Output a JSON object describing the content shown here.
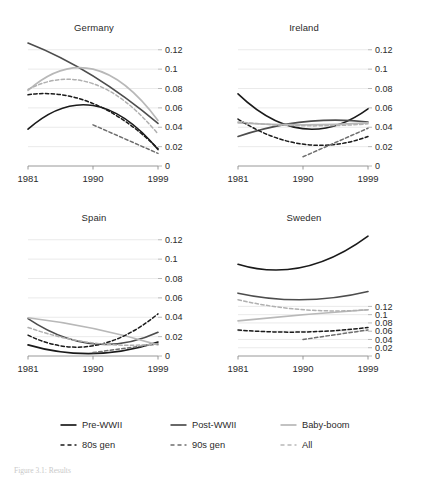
{
  "figure": {
    "caption": "Figure 3.1: Results"
  },
  "chart_data": [
    {
      "type": "line",
      "title": "Germany",
      "xlabel": "",
      "ylabel": "",
      "x": [
        1981,
        1990,
        1999
      ],
      "xticks": [
        "1981",
        "1990",
        "1999"
      ],
      "yticks": [
        "0",
        "0.02",
        "0.04",
        "0.06",
        "0.08",
        "0.1",
        "0.12"
      ],
      "ytickvalues": [
        0,
        0.02,
        0.04,
        0.06,
        0.08,
        0.1,
        0.12
      ],
      "ylim": [
        0,
        0.128
      ],
      "grid": true,
      "legend_position": "below-figure",
      "series": [
        {
          "name": "Pre-WWII",
          "style": "solid",
          "color": "#1a1a1a",
          "values": [
            0.038,
            0.0625,
            0.017
          ]
        },
        {
          "name": "Post-WWII",
          "style": "solid",
          "color": "#4d4d4d",
          "values": [
            0.127,
            0.093,
            0.044
          ]
        },
        {
          "name": "Baby-boom",
          "style": "solid",
          "color": "#b8b8b8",
          "values": [
            0.078,
            0.1,
            0.047
          ]
        },
        {
          "name": "80s gen",
          "style": "dashed",
          "color": "#1a1a1a",
          "values": [
            0.0735,
            0.0645,
            0.018
          ]
        },
        {
          "name": "90s gen",
          "style": "dashed",
          "color": "#6e6e6e",
          "values": [
            null,
            0.0425,
            0.013
          ]
        },
        {
          "name": "All",
          "style": "dashed",
          "color": "#b0b0b0",
          "values": [
            0.079,
            0.085,
            0.033
          ]
        }
      ]
    },
    {
      "type": "line",
      "title": "Ireland",
      "xlabel": "",
      "ylabel": "",
      "x": [
        1981,
        1990,
        1999
      ],
      "xticks": [
        "1981",
        "1990",
        "1999"
      ],
      "yticks": [
        "0",
        "0.02",
        "0.04",
        "0.06",
        "0.08",
        "0.1",
        "0.12"
      ],
      "ytickvalues": [
        0,
        0.02,
        0.04,
        0.06,
        0.08,
        0.1,
        0.12
      ],
      "ylim": [
        0,
        0.128
      ],
      "grid": true,
      "legend_position": "below-figure",
      "series": [
        {
          "name": "Pre-WWII",
          "style": "solid",
          "color": "#1a1a1a",
          "values": [
            0.0745,
            0.0385,
            0.059
          ]
        },
        {
          "name": "Post-WWII",
          "style": "solid",
          "color": "#4d4d4d",
          "values": [
            0.0305,
            0.0455,
            0.0455
          ]
        },
        {
          "name": "Baby-boom",
          "style": "solid",
          "color": "#b8b8b8",
          "values": [
            0.0445,
            0.0425,
            0.0445
          ]
        },
        {
          "name": "80s gen",
          "style": "dashed",
          "color": "#1a1a1a",
          "values": [
            0.0485,
            0.0225,
            0.0305
          ]
        },
        {
          "name": "90s gen",
          "style": "dashed",
          "color": "#6e6e6e",
          "values": [
            null,
            0.0095,
            0.039
          ]
        },
        {
          "name": "All",
          "style": "dashed",
          "color": "#b0b0b0",
          "values": [
            0.0455,
            0.0415,
            0.0435
          ]
        }
      ]
    },
    {
      "type": "line",
      "title": "Spain",
      "xlabel": "",
      "ylabel": "",
      "x": [
        1981,
        1990,
        1999
      ],
      "xticks": [
        "1981",
        "1990",
        "1999"
      ],
      "yticks": [
        "0",
        "0.02",
        "0.04",
        "0.06",
        "0.08",
        "0.1",
        "0.12"
      ],
      "ytickvalues": [
        0,
        0.02,
        0.04,
        0.06,
        0.08,
        0.1,
        0.12
      ],
      "ylim": [
        0,
        0.128
      ],
      "grid": true,
      "legend_position": "below-figure",
      "series": [
        {
          "name": "Pre-WWII",
          "style": "solid",
          "color": "#1a1a1a",
          "values": [
            0.0115,
            0.0025,
            0.0145
          ]
        },
        {
          "name": "Post-WWII",
          "style": "solid",
          "color": "#4d4d4d",
          "values": [
            0.0385,
            0.0125,
            0.0245
          ]
        },
        {
          "name": "Baby-boom",
          "style": "solid",
          "color": "#b8b8b8",
          "values": [
            0.0395,
            0.0285,
            0.0115
          ]
        },
        {
          "name": "80s gen",
          "style": "dashed",
          "color": "#1a1a1a",
          "values": [
            0.0215,
            0.0105,
            0.0435
          ]
        },
        {
          "name": "90s gen",
          "style": "dashed",
          "color": "#6e6e6e",
          "values": [
            null,
            0.0035,
            0.0125
          ]
        },
        {
          "name": "All",
          "style": "dashed",
          "color": "#b0b0b0",
          "values": [
            0.0295,
            0.0135,
            0.0125
          ]
        }
      ]
    },
    {
      "type": "line",
      "title": "Sweden",
      "xlabel": "",
      "ylabel": "",
      "x": [
        1981,
        1990,
        1999
      ],
      "xticks": [
        "1981",
        "1990",
        "1999"
      ],
      "yticks": [
        "0",
        "0.02",
        "0.04",
        "0.06",
        "0.08",
        "0.1",
        "0.12"
      ],
      "ytickvalues": [
        0,
        0.02,
        0.04,
        0.06,
        0.08,
        0.1,
        0.12
      ],
      "ylim": [
        0,
        0.3
      ],
      "grid": true,
      "legend_position": "below-figure",
      "note": "axis labels compressed in lower portion of panel",
      "series": [
        {
          "name": "Pre-WWII",
          "style": "solid",
          "color": "#1a1a1a",
          "values": [
            0.222,
            0.215,
            0.29
          ]
        },
        {
          "name": "Post-WWII",
          "style": "solid",
          "color": "#4d4d4d",
          "values": [
            0.152,
            0.136,
            0.156
          ]
        },
        {
          "name": "Baby-boom",
          "style": "solid",
          "color": "#b8b8b8",
          "values": [
            0.085,
            0.1,
            0.112
          ]
        },
        {
          "name": "80s gen",
          "style": "dashed",
          "color": "#1a1a1a",
          "values": [
            0.063,
            0.058,
            0.069
          ]
        },
        {
          "name": "90s gen",
          "style": "dashed",
          "color": "#6e6e6e",
          "values": [
            null,
            0.04,
            0.063
          ]
        },
        {
          "name": "All",
          "style": "dashed",
          "color": "#b0b0b0",
          "values": [
            0.136,
            0.112,
            0.112
          ]
        }
      ]
    }
  ],
  "legend": {
    "rows": [
      [
        {
          "label": "Pre-WWII",
          "style": "solid",
          "color": "#1a1a1a"
        },
        {
          "label": "Post-WWII",
          "style": "solid",
          "color": "#4d4d4d"
        },
        {
          "label": "Baby-boom",
          "style": "solid",
          "color": "#b8b8b8"
        }
      ],
      [
        {
          "label": "80s gen",
          "style": "dashed",
          "color": "#1a1a1a"
        },
        {
          "label": "90s gen",
          "style": "dashed",
          "color": "#6e6e6e"
        },
        {
          "label": "All",
          "style": "dashed",
          "color": "#b8b8b8"
        }
      ]
    ]
  }
}
